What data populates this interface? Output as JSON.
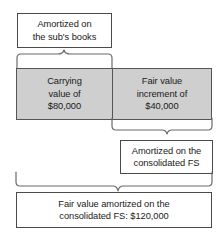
{
  "diagram": {
    "colors": {
      "gray_fill": "#cfcfcf",
      "box_border": "#4a4a4a",
      "brace_stroke": "#6b6b6b",
      "background": "#ffffff",
      "text": "#1a1a1a"
    },
    "nodes": {
      "top": {
        "label": "Amortized on\nthe sub's books"
      },
      "carrying": {
        "label": "Carrying\nvalue of\n$80,000",
        "amount": "$80,000"
      },
      "increment": {
        "label": "Fair value\nincrement of\n$40,000",
        "amount": "$40,000"
      },
      "consolidated": {
        "label": "Amortized on the\nconsolidated FS"
      },
      "total": {
        "label": "Fair value amortized on the\nconsolidated FS: $120,000",
        "amount": "$120,000"
      }
    },
    "connectors": [
      {
        "name": "brace-top",
        "from": "top",
        "to": "carrying"
      },
      {
        "name": "brace-mid",
        "from": "increment",
        "to": "consolidated"
      },
      {
        "name": "brace-bottom",
        "from": "carrying-and-increment",
        "to": "total"
      }
    ]
  }
}
